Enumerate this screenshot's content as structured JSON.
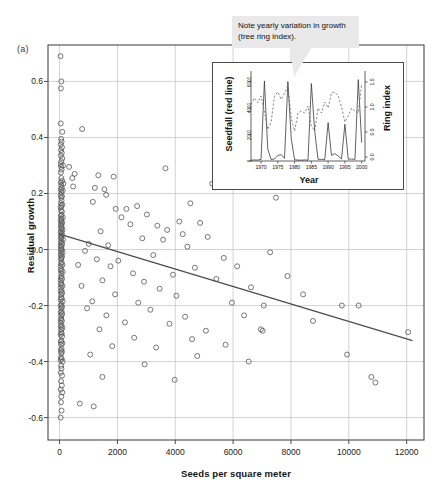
{
  "figure": {
    "panel_label": "(a)",
    "background_color": "#ffffff",
    "grid_color": "#c8c8c8",
    "axis_color": "#4a4a4a",
    "point_color": "#555555",
    "trend_color": "#4c4c4c"
  },
  "callout": {
    "text": "Note yearly variation in growth (tree ring index).",
    "background_color": "#e9e9e9",
    "text_color": "#111111"
  },
  "chart_data": [
    {
      "type": "scatter",
      "name": "main-scatter",
      "title": "",
      "xlabel": "Seeds per square meter",
      "ylabel": "Residual growth",
      "xlim": [
        -400,
        12600
      ],
      "ylim": [
        -0.68,
        0.73
      ],
      "xticks": [
        0,
        2000,
        4000,
        6000,
        8000,
        10000,
        12000
      ],
      "xtick_labels": [
        "0",
        "2000",
        "4000",
        "6000",
        "8000",
        "10000",
        "12000"
      ],
      "yticks": [
        -0.6,
        -0.4,
        -0.2,
        0.0,
        0.2,
        0.4,
        0.6
      ],
      "ytick_labels": [
        "-0.6",
        "-0.4",
        "-0.2",
        "0.0",
        "0.2",
        "0.4",
        "0.6"
      ],
      "grid": true,
      "legend": "none",
      "marker": "open-circle",
      "trendline": {
        "type": "linear",
        "x": [
          0,
          12200
        ],
        "y": [
          0.055,
          -0.325
        ],
        "slope": -3.11e-05,
        "intercept": 0.055
      },
      "points": [
        [
          30,
          0.69
        ],
        [
          60,
          0.6
        ],
        [
          45,
          0.575
        ],
        [
          40,
          0.45
        ],
        [
          95,
          0.42
        ],
        [
          780,
          0.43
        ],
        [
          55,
          0.395
        ],
        [
          70,
          0.385
        ],
        [
          40,
          0.375
        ],
        [
          85,
          0.365
        ],
        [
          50,
          0.355
        ],
        [
          75,
          0.345
        ],
        [
          45,
          0.335
        ],
        [
          95,
          0.325
        ],
        [
          60,
          0.315
        ],
        [
          40,
          0.305
        ],
        [
          120,
          0.3
        ],
        [
          55,
          0.295
        ],
        [
          70,
          0.285
        ],
        [
          45,
          0.275
        ],
        [
          330,
          0.295
        ],
        [
          520,
          0.27
        ],
        [
          1340,
          0.265
        ],
        [
          1870,
          0.26
        ],
        [
          3660,
          0.29
        ],
        [
          60,
          0.255
        ],
        [
          90,
          0.245
        ],
        [
          40,
          0.24
        ],
        [
          130,
          0.235
        ],
        [
          55,
          0.23
        ],
        [
          440,
          0.255
        ],
        [
          470,
          0.225
        ],
        [
          8050,
          0.245
        ],
        [
          5280,
          0.235
        ],
        [
          75,
          0.22
        ],
        [
          45,
          0.215
        ],
        [
          105,
          0.21
        ],
        [
          60,
          0.205
        ],
        [
          1220,
          0.22
        ],
        [
          1550,
          0.215
        ],
        [
          1610,
          0.195
        ],
        [
          7480,
          0.185
        ],
        [
          40,
          0.195
        ],
        [
          85,
          0.19
        ],
        [
          55,
          0.185
        ],
        [
          70,
          0.175
        ],
        [
          1150,
          0.17
        ],
        [
          4520,
          0.165
        ],
        [
          45,
          0.165
        ],
        [
          95,
          0.16
        ],
        [
          60,
          0.155
        ],
        [
          40,
          0.15
        ],
        [
          1940,
          0.145
        ],
        [
          2310,
          0.145
        ],
        [
          2680,
          0.155
        ],
        [
          50,
          0.14
        ],
        [
          80,
          0.135
        ],
        [
          65,
          0.125
        ],
        [
          45,
          0.12
        ],
        [
          110,
          0.115
        ],
        [
          55,
          0.11
        ],
        [
          2140,
          0.115
        ],
        [
          3020,
          0.125
        ],
        [
          70,
          0.105
        ],
        [
          40,
          0.1
        ],
        [
          90,
          0.095
        ],
        [
          60,
          0.09
        ],
        [
          2450,
          0.09
        ],
        [
          3380,
          0.085
        ],
        [
          4140,
          0.1
        ],
        [
          4860,
          0.095
        ],
        [
          50,
          0.085
        ],
        [
          75,
          0.08
        ],
        [
          45,
          0.075
        ],
        [
          100,
          0.07
        ],
        [
          62,
          0.065
        ],
        [
          38,
          0.06
        ],
        [
          1420,
          0.065
        ],
        [
          3720,
          0.07
        ],
        [
          4260,
          0.055
        ],
        [
          85,
          0.055
        ],
        [
          55,
          0.05
        ],
        [
          70,
          0.045
        ],
        [
          42,
          0.04
        ],
        [
          115,
          0.035
        ],
        [
          2860,
          0.04
        ],
        [
          3580,
          0.035
        ],
        [
          5120,
          0.045
        ],
        [
          60,
          0.03
        ],
        [
          48,
          0.025
        ],
        [
          92,
          0.02
        ],
        [
          38,
          0.015
        ],
        [
          66,
          0.01
        ],
        [
          1010,
          0.02
        ],
        [
          1680,
          0.015
        ],
        [
          4420,
          0.01
        ],
        [
          52,
          0.005
        ],
        [
          78,
          0.0
        ],
        [
          44,
          -0.005
        ],
        [
          105,
          -0.01
        ],
        [
          58,
          -0.015
        ],
        [
          880,
          -0.005
        ],
        [
          3240,
          -0.02
        ],
        [
          7280,
          -0.01
        ],
        [
          40,
          -0.02
        ],
        [
          88,
          -0.025
        ],
        [
          62,
          -0.03
        ],
        [
          46,
          -0.035
        ],
        [
          1290,
          -0.035
        ],
        [
          2030,
          -0.04
        ],
        [
          5680,
          -0.03
        ],
        [
          72,
          -0.045
        ],
        [
          50,
          -0.05
        ],
        [
          96,
          -0.055
        ],
        [
          38,
          -0.06
        ],
        [
          640,
          -0.055
        ],
        [
          1760,
          -0.06
        ],
        [
          4680,
          -0.065
        ],
        [
          6140,
          -0.06
        ],
        [
          64,
          -0.07
        ],
        [
          42,
          -0.075
        ],
        [
          108,
          -0.08
        ],
        [
          56,
          -0.085
        ],
        [
          2540,
          -0.085
        ],
        [
          3920,
          -0.09
        ],
        [
          7880,
          -0.095
        ],
        [
          70,
          -0.095
        ],
        [
          46,
          -0.1
        ],
        [
          84,
          -0.105
        ],
        [
          38,
          -0.11
        ],
        [
          1480,
          -0.11
        ],
        [
          2920,
          -0.115
        ],
        [
          5420,
          -0.105
        ],
        [
          60,
          -0.12
        ],
        [
          52,
          -0.125
        ],
        [
          98,
          -0.13
        ],
        [
          44,
          -0.135
        ],
        [
          760,
          -0.13
        ],
        [
          3460,
          -0.14
        ],
        [
          6620,
          -0.135
        ],
        [
          68,
          -0.145
        ],
        [
          40,
          -0.15
        ],
        [
          90,
          -0.155
        ],
        [
          58,
          -0.16
        ],
        [
          1920,
          -0.16
        ],
        [
          4040,
          -0.165
        ],
        [
          8420,
          -0.16
        ],
        [
          48,
          -0.17
        ],
        [
          76,
          -0.175
        ],
        [
          36,
          -0.18
        ],
        [
          104,
          -0.185
        ],
        [
          1130,
          -0.185
        ],
        [
          2720,
          -0.19
        ],
        [
          5960,
          -0.19
        ],
        [
          62,
          -0.195
        ],
        [
          44,
          -0.2
        ],
        [
          86,
          -0.205
        ],
        [
          54,
          -0.21
        ],
        [
          950,
          -0.21
        ],
        [
          3140,
          -0.215
        ],
        [
          7060,
          -0.2
        ],
        [
          9760,
          -0.2
        ],
        [
          10340,
          -0.2
        ],
        [
          70,
          -0.22
        ],
        [
          40,
          -0.225
        ],
        [
          92,
          -0.23
        ],
        [
          50,
          -0.235
        ],
        [
          1620,
          -0.235
        ],
        [
          4340,
          -0.24
        ],
        [
          6380,
          -0.235
        ],
        [
          58,
          -0.245
        ],
        [
          46,
          -0.25
        ],
        [
          80,
          -0.255
        ],
        [
          38,
          -0.26
        ],
        [
          2260,
          -0.26
        ],
        [
          3800,
          -0.265
        ],
        [
          8760,
          -0.255
        ],
        [
          66,
          -0.27
        ],
        [
          42,
          -0.275
        ],
        [
          100,
          -0.28
        ],
        [
          56,
          -0.285
        ],
        [
          1380,
          -0.285
        ],
        [
          5060,
          -0.29
        ],
        [
          6960,
          -0.285
        ],
        [
          7020,
          -0.29
        ],
        [
          48,
          -0.295
        ],
        [
          74,
          -0.3
        ],
        [
          36,
          -0.305
        ],
        [
          88,
          -0.31
        ],
        [
          2580,
          -0.315
        ],
        [
          4580,
          -0.32
        ],
        [
          12050,
          -0.295
        ],
        [
          60,
          -0.325
        ],
        [
          44,
          -0.33
        ],
        [
          96,
          -0.335
        ],
        [
          52,
          -0.34
        ],
        [
          1820,
          -0.345
        ],
        [
          3340,
          -0.35
        ],
        [
          5740,
          -0.34
        ],
        [
          68,
          -0.355
        ],
        [
          40,
          -0.36
        ],
        [
          82,
          -0.365
        ],
        [
          58,
          -0.37
        ],
        [
          1060,
          -0.375
        ],
        [
          4760,
          -0.38
        ],
        [
          9940,
          -0.375
        ],
        [
          46,
          -0.385
        ],
        [
          72,
          -0.39
        ],
        [
          38,
          -0.395
        ],
        [
          104,
          -0.4
        ],
        [
          2940,
          -0.41
        ],
        [
          6540,
          -0.4
        ],
        [
          54,
          -0.415
        ],
        [
          64,
          -0.425
        ],
        [
          42,
          -0.44
        ],
        [
          86,
          -0.45
        ],
        [
          1480,
          -0.455
        ],
        [
          3980,
          -0.465
        ],
        [
          50,
          -0.47
        ],
        [
          76,
          -0.485
        ],
        [
          40,
          -0.5
        ],
        [
          92,
          -0.51
        ],
        [
          10780,
          -0.455
        ],
        [
          10920,
          -0.475
        ],
        [
          60,
          -0.525
        ],
        [
          48,
          -0.545
        ],
        [
          700,
          -0.55
        ],
        [
          1180,
          -0.56
        ],
        [
          68,
          -0.575
        ],
        [
          38,
          -0.6
        ]
      ]
    },
    {
      "type": "line",
      "name": "inset-timeseries",
      "title": "",
      "xlabel": "Year",
      "ylabel": "Seedfall (red line)",
      "y2label": "Ring index",
      "xlim": [
        1967,
        2001
      ],
      "ylim": [
        0,
        6800
      ],
      "y2lim": [
        -0.08,
        1.72
      ],
      "xticks": [
        1970,
        1975,
        1980,
        1985,
        1990,
        1995,
        2000
      ],
      "xtick_labels": [
        "1970",
        "1975",
        "1980",
        "1985",
        "1990",
        "1995",
        "2000"
      ],
      "yticks": [
        0,
        2000,
        4000,
        6000
      ],
      "ytick_labels": [
        "0",
        "2000",
        "4000",
        "6000"
      ],
      "y2ticks": [
        0.0,
        0.5,
        1.0,
        1.5
      ],
      "y2tick_labels": [
        "0.0",
        "0.5",
        "1.0",
        "1.5"
      ],
      "grid": false,
      "legend": "none",
      "series": [
        {
          "name": "Seedfall",
          "style": "solid",
          "axis": "left",
          "x": [
            1967,
            1968,
            1969,
            1970,
            1971,
            1972,
            1973,
            1974,
            1975,
            1976,
            1977,
            1978,
            1979,
            1980,
            1981,
            1982,
            1983,
            1984,
            1985,
            1986,
            1987,
            1988,
            1989,
            1990,
            1991,
            1992,
            1993,
            1994,
            1995,
            1996,
            1997,
            1998,
            1999,
            2000
          ],
          "values": [
            60,
            80,
            70,
            120,
            6050,
            900,
            110,
            150,
            420,
            480,
            200,
            6000,
            1700,
            90,
            70,
            60,
            80,
            60,
            5850,
            2250,
            120,
            130,
            100,
            2900,
            420,
            560,
            380,
            150,
            2780,
            130,
            150,
            120,
            6150,
            1400
          ]
        },
        {
          "name": "Ring index",
          "style": "dashed",
          "axis": "right",
          "x": [
            1967,
            1968,
            1969,
            1970,
            1971,
            1972,
            1973,
            1974,
            1975,
            1976,
            1977,
            1978,
            1979,
            1980,
            1981,
            1982,
            1983,
            1984,
            1985,
            1986,
            1987,
            1988,
            1989,
            1990,
            1991,
            1992,
            1993,
            1994,
            1995,
            1996,
            1997,
            1998,
            1999,
            2000
          ],
          "values": [
            1.05,
            1.18,
            1.08,
            1.22,
            0.92,
            0.55,
            0.7,
            1.22,
            1.3,
            1.15,
            1.28,
            1.42,
            0.78,
            0.52,
            0.88,
            0.92,
            0.88,
            1.02,
            0.62,
            0.52,
            0.98,
            0.88,
            1.1,
            0.98,
            1.28,
            1.3,
            1.22,
            1.0,
            0.7,
            0.82,
            0.98,
            0.92,
            0.88,
            1.45
          ]
        }
      ]
    }
  ]
}
